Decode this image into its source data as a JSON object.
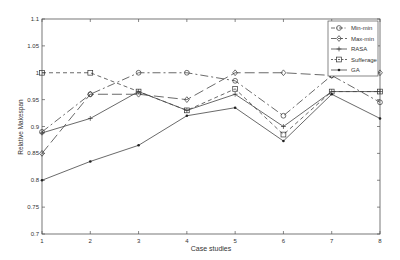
{
  "chart_data": {
    "type": "line",
    "title": "",
    "xlabel": "Case studies",
    "ylabel": "Relative Makespan",
    "x": [
      1,
      2,
      3,
      4,
      5,
      6,
      7,
      8
    ],
    "xlim": [
      1,
      8
    ],
    "ylim": [
      0.7,
      1.1
    ],
    "yticks": [
      0.7,
      0.75,
      0.8,
      0.85,
      0.9,
      0.95,
      1,
      1.05,
      1.1
    ],
    "ytick_labels": [
      "0.7",
      "0.75",
      "0.8",
      "0.85",
      "0.9",
      "0.95",
      "1",
      "1.05",
      "1.1"
    ],
    "xticks": [
      1,
      2,
      3,
      4,
      5,
      6,
      7,
      8
    ],
    "grid": false,
    "legend_position": "upper right",
    "series": [
      {
        "name": "Min-min",
        "marker": "circle",
        "dash": "8,3,2,3",
        "values": [
          0.89,
          0.96,
          1.0,
          1.0,
          0.985,
          0.92,
          0.995,
          0.945
        ]
      },
      {
        "name": "Max-min",
        "marker": "diamond",
        "dash": "10,4",
        "values": [
          0.85,
          0.96,
          0.96,
          0.95,
          1.0,
          1.0,
          0.995,
          1.0
        ]
      },
      {
        "name": "RASA",
        "marker": "plus",
        "dash": "",
        "values": [
          0.888,
          0.915,
          0.965,
          0.93,
          0.96,
          0.9,
          0.965,
          0.965
        ]
      },
      {
        "name": "Sufferage",
        "marker": "square",
        "dash": "4,3",
        "values": [
          1.0,
          1.0,
          0.965,
          0.93,
          0.97,
          0.885,
          0.965,
          0.965
        ]
      },
      {
        "name": "GA",
        "marker": "star",
        "dash": "",
        "values": [
          0.8,
          0.835,
          0.865,
          0.92,
          0.935,
          0.873,
          0.96,
          0.915
        ]
      }
    ]
  }
}
